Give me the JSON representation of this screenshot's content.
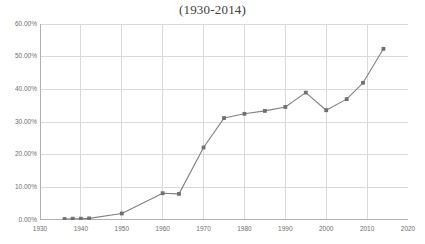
{
  "chart_data": {
    "type": "line",
    "title": "(1930-2014)",
    "xlabel": "",
    "ylabel": "",
    "xlim": [
      1930,
      2020
    ],
    "ylim": [
      0,
      60
    ],
    "grid": true,
    "legend": false,
    "y_tick_labels": [
      "60.00%",
      "50.00%",
      "40.00%",
      "30.00%",
      "20.00%",
      "10.00%",
      "0.00%"
    ],
    "y_ticks": [
      60,
      50,
      40,
      30,
      20,
      10,
      0
    ],
    "x_tick_labels": [
      "1930",
      "1940",
      "1950",
      "1960",
      "1970",
      "1980",
      "1990",
      "2000",
      "2010",
      "2020"
    ],
    "x_ticks": [
      1930,
      1940,
      1950,
      1960,
      1970,
      1980,
      1990,
      2000,
      2010,
      2020
    ],
    "series": [
      {
        "name": "series-1",
        "color": "#808080",
        "marker": "square",
        "x": [
          1936,
          1938,
          1940,
          1942,
          1950,
          1960,
          1964,
          1970,
          1975,
          1980,
          1985,
          1990,
          1995,
          2000,
          2005,
          2009,
          2014
        ],
        "values": [
          0.3,
          0.4,
          0.4,
          0.5,
          2.0,
          8.2,
          8.0,
          22.2,
          31.2,
          32.5,
          33.4,
          34.6,
          39.0,
          33.6,
          37.0,
          42.0,
          52.4
        ]
      }
    ]
  },
  "colors": {
    "line": "#808080",
    "marker": "#707070",
    "grid": "#d9d9d9",
    "axis": "#b0b0b0",
    "tick_text": "#6e6e6e",
    "title_text": "#404040",
    "background": "#ffffff"
  }
}
